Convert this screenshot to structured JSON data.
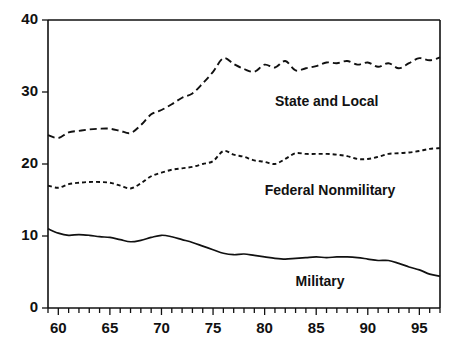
{
  "chart_data": {
    "type": "line",
    "title": "",
    "subtitle": "",
    "xlabel": "",
    "ylabel": "",
    "xlim": [
      59,
      97
    ],
    "ylim": [
      0,
      40
    ],
    "grid": false,
    "legend_position": "inline-annotations",
    "y_ticks": [
      0,
      10,
      20,
      30,
      40
    ],
    "y_tick_labels": [
      "0",
      "10",
      "20",
      "30",
      "40"
    ],
    "x_ticks": [
      59,
      60,
      61,
      62,
      63,
      64,
      65,
      66,
      67,
      68,
      69,
      70,
      71,
      72,
      73,
      74,
      75,
      76,
      77,
      78,
      79,
      80,
      81,
      82,
      83,
      84,
      85,
      86,
      87,
      88,
      89,
      90,
      91,
      92,
      93,
      94,
      95,
      96,
      97
    ],
    "x_tick_labels": [
      "60",
      "65",
      "70",
      "75",
      "80",
      "85",
      "90",
      "95"
    ],
    "x_labeled_ticks": [
      60,
      65,
      70,
      75,
      80,
      85,
      90,
      95
    ],
    "annotations": [
      {
        "text": "State and Local",
        "x": 81.0,
        "y": 28.6
      },
      {
        "text": "Federal Nonmilitary",
        "x": 80.0,
        "y": 16.2
      },
      {
        "text": "Military",
        "x": 83.0,
        "y": 3.6
      }
    ],
    "x": [
      59,
      60,
      61,
      62,
      63,
      64,
      65,
      66,
      67,
      68,
      69,
      70,
      71,
      72,
      73,
      74,
      75,
      76,
      77,
      78,
      79,
      80,
      81,
      82,
      83,
      84,
      85,
      86,
      87,
      88,
      89,
      90,
      91,
      92,
      93,
      94,
      95,
      96,
      97
    ],
    "series": [
      {
        "name": "State and Local",
        "style": "long-dash",
        "color": "#111111",
        "values": [
          24.0,
          23.6,
          24.4,
          24.6,
          24.8,
          24.9,
          24.9,
          24.6,
          24.3,
          25.4,
          26.9,
          27.5,
          28.3,
          29.2,
          29.8,
          31.2,
          32.8,
          34.7,
          33.9,
          33.2,
          32.8,
          33.8,
          33.4,
          34.3,
          33.0,
          33.3,
          33.6,
          34.1,
          34.0,
          34.3,
          33.8,
          34.1,
          33.5,
          34.0,
          33.3,
          34.0,
          34.7,
          34.4,
          34.8
        ]
      },
      {
        "name": "Federal Nonmilitary",
        "style": "short-dash",
        "color": "#111111",
        "values": [
          17.0,
          16.7,
          17.2,
          17.4,
          17.5,
          17.5,
          17.4,
          17.0,
          16.6,
          17.3,
          18.3,
          18.8,
          19.2,
          19.4,
          19.6,
          20.0,
          20.4,
          21.8,
          21.3,
          21.0,
          20.5,
          20.3,
          20.0,
          20.7,
          21.5,
          21.4,
          21.4,
          21.4,
          21.3,
          21.1,
          20.7,
          20.7,
          21.0,
          21.4,
          21.5,
          21.6,
          21.8,
          22.1,
          22.2
        ]
      },
      {
        "name": "Military",
        "style": "solid",
        "color": "#111111",
        "values": [
          11.0,
          10.4,
          10.1,
          10.2,
          10.1,
          9.9,
          9.8,
          9.5,
          9.2,
          9.4,
          9.8,
          10.1,
          9.9,
          9.5,
          9.1,
          8.6,
          8.1,
          7.6,
          7.4,
          7.5,
          7.3,
          7.1,
          6.9,
          6.8,
          6.9,
          7.0,
          7.1,
          7.0,
          7.1,
          7.1,
          7.0,
          6.8,
          6.6,
          6.6,
          6.2,
          5.7,
          5.3,
          4.7,
          4.4
        ]
      }
    ]
  }
}
